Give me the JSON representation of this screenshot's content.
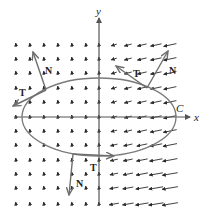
{
  "figure": {
    "colors": {
      "field": "#2a2a2a",
      "axes": "#555555",
      "curve": "#7a7a7a",
      "vectors": "#6e6e6e",
      "text": "#222222"
    },
    "axes": {
      "x_label": "x",
      "y_label": "y",
      "origin": [
        99,
        117
      ]
    },
    "curve": {
      "label": "C",
      "type": "ellipse",
      "center": [
        99,
        117
      ],
      "rx": 77,
      "ry": 39
    },
    "frames": [
      {
        "name": "upper-left",
        "point": [
          46,
          90
        ],
        "T_end": [
          13,
          106
        ],
        "N_end": [
          33,
          52
        ],
        "T_label": "T",
        "N_label": "N",
        "T_label_pos": [
          19,
          96
        ],
        "N_label_pos": [
          45,
          74
        ]
      },
      {
        "name": "upper-right",
        "point": [
          147,
          88
        ],
        "T_end": [
          116,
          66
        ],
        "N_end": [
          168,
          51
        ],
        "T_label": "T",
        "N_label": "N",
        "T_label_pos": [
          133,
          77
        ],
        "N_label_pos": [
          169,
          74
        ]
      },
      {
        "name": "bottom",
        "point": [
          73,
          154
        ],
        "T_end": [
          114,
          156
        ],
        "N_end": [
          69,
          195
        ],
        "T_label": "T",
        "N_label": "N",
        "T_label_pos": [
          90,
          171
        ],
        "N_label_pos": [
          76,
          187
        ]
      }
    ],
    "grid": {
      "xs": [
        16,
        30,
        44,
        58,
        72,
        86,
        99,
        114,
        128,
        142,
        156,
        170
      ],
      "ys": [
        45,
        59,
        73,
        88,
        102,
        117,
        131,
        145,
        160,
        174,
        188,
        204
      ]
    }
  }
}
